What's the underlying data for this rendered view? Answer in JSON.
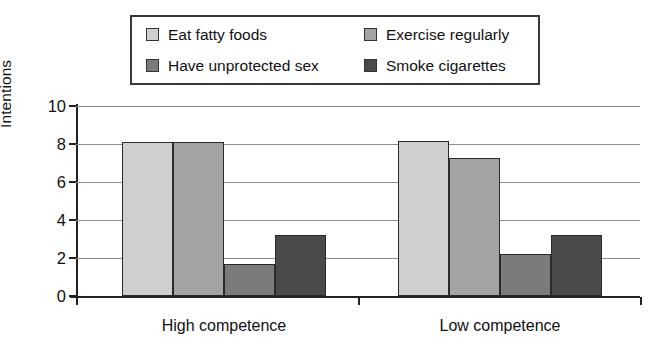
{
  "chart_data": {
    "type": "bar",
    "title": "",
    "xlabel": "",
    "ylabel": "Intentions",
    "ylim": [
      0,
      10
    ],
    "ytick_values": [
      0,
      2,
      4,
      6,
      8,
      10
    ],
    "ytick_labels": [
      "0",
      "2",
      "4",
      "6",
      "8",
      "10"
    ],
    "grid": true,
    "legend_position": "above-plot",
    "categories": [
      "High competence",
      "Low competence"
    ],
    "series": [
      {
        "name": "Eat fatty foods",
        "color": "#cfcfcf",
        "values": [
          8.1,
          8.15
        ]
      },
      {
        "name": "Exercise regularly",
        "color": "#a3a3a3",
        "values": [
          8.1,
          7.25
        ]
      },
      {
        "name": "Have unprotected sex",
        "color": "#7b7b7b",
        "values": [
          1.7,
          2.2
        ]
      },
      {
        "name": "Smoke cigarettes",
        "color": "#4a4a4a",
        "values": [
          3.2,
          3.2
        ]
      }
    ]
  },
  "legend": {
    "entries": [
      {
        "label": "Eat fatty foods",
        "color": "#cfcfcf"
      },
      {
        "label": "Exercise regularly",
        "color": "#a3a3a3"
      },
      {
        "label": "Have unprotected sex",
        "color": "#7b7b7b"
      },
      {
        "label": "Smoke cigarettes",
        "color": "#4a4a4a"
      }
    ]
  },
  "axes": {
    "y_title": "Intentions",
    "y_ticks": [
      "10",
      "8",
      "6",
      "4",
      "2",
      "0"
    ],
    "x_groups": [
      "High competence",
      "Low competence"
    ]
  }
}
